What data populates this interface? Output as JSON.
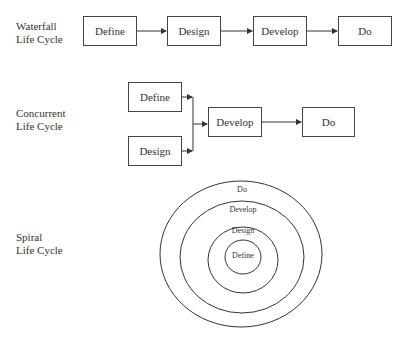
{
  "waterfall": {
    "label_line1": "Waterfall",
    "label_line2": "Life Cycle",
    "steps": [
      "Define",
      "Design",
      "Develop",
      "Do"
    ]
  },
  "concurrent": {
    "label_line1": "Concurrent",
    "label_line2": "Life Cycle",
    "parallel": [
      "Define",
      "Design"
    ],
    "steps": [
      "Develop",
      "Do"
    ]
  },
  "spiral": {
    "label_line1": "Spiral",
    "label_line2": "Life Cycle",
    "rings_outer_to_inner": [
      "Do",
      "Develop",
      "Design",
      "Define"
    ]
  }
}
